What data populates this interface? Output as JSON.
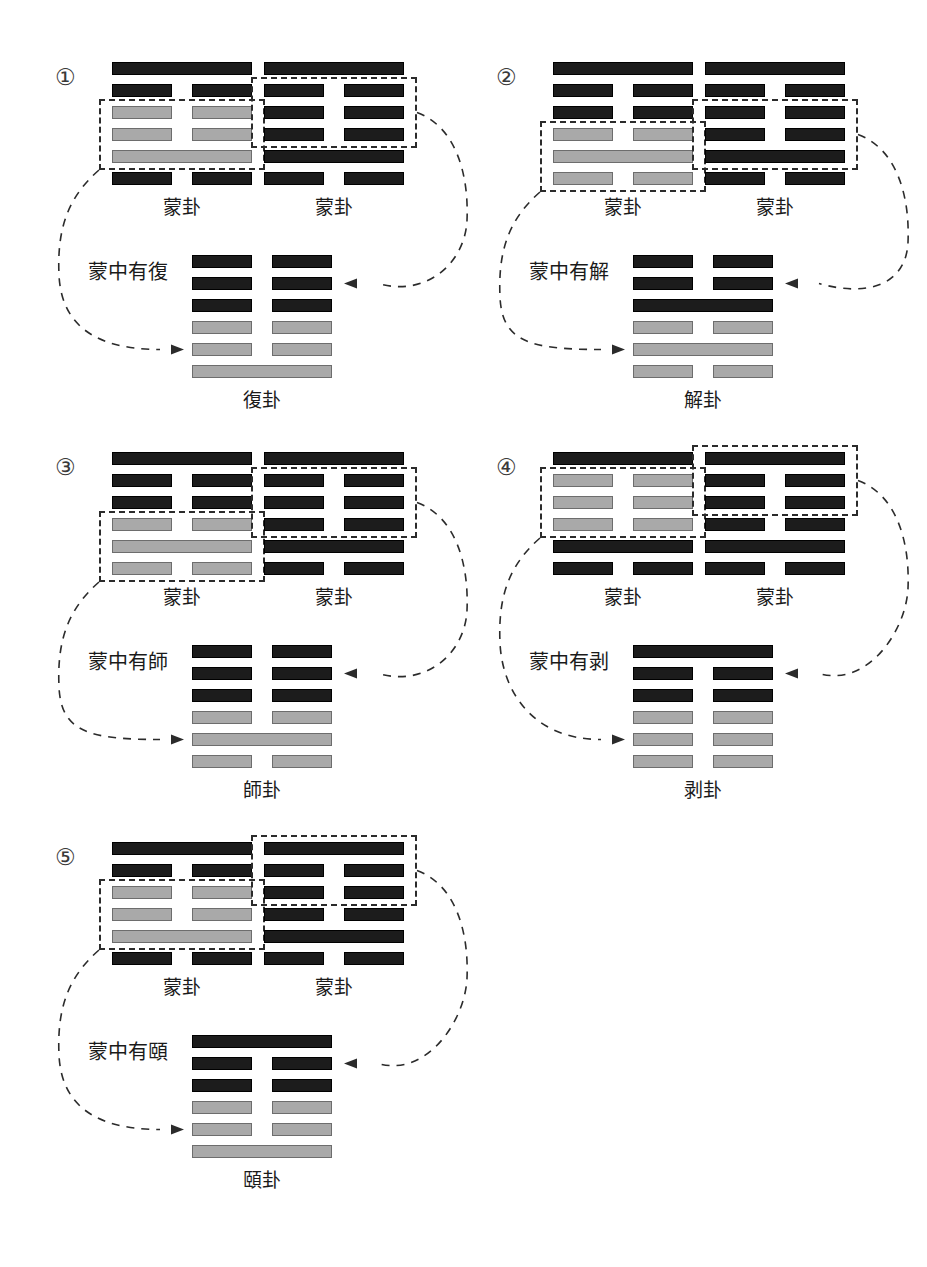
{
  "palette": {
    "dark_line": "#1c1c1c",
    "gray_line": "#a9a9a9",
    "dash_stroke": "#2b2b2b",
    "background": "#ffffff"
  },
  "figure": {
    "hexagram_line_types": [
      "solid",
      "broken"
    ],
    "hexagram_line_shades": [
      "dark",
      "gray"
    ]
  },
  "groups": [
    {
      "number": "①",
      "source_left": {
        "label": "蒙卦",
        "lines": [
          {
            "type": "solid",
            "shade": "dark"
          },
          {
            "type": "broken",
            "shade": "dark"
          },
          {
            "type": "broken",
            "shade": "gray"
          },
          {
            "type": "broken",
            "shade": "gray"
          },
          {
            "type": "solid",
            "shade": "gray"
          },
          {
            "type": "broken",
            "shade": "dark"
          }
        ],
        "selection": [
          3,
          4,
          5
        ]
      },
      "source_right": {
        "label": "蒙卦",
        "lines": [
          {
            "type": "solid",
            "shade": "dark"
          },
          {
            "type": "broken",
            "shade": "dark"
          },
          {
            "type": "broken",
            "shade": "dark"
          },
          {
            "type": "broken",
            "shade": "dark"
          },
          {
            "type": "solid",
            "shade": "dark"
          },
          {
            "type": "broken",
            "shade": "dark"
          }
        ],
        "selection": [
          2,
          3,
          4
        ]
      },
      "phrase": "蒙中有復",
      "result": {
        "label": "復卦",
        "lines": [
          {
            "type": "broken",
            "shade": "dark"
          },
          {
            "type": "broken",
            "shade": "dark"
          },
          {
            "type": "broken",
            "shade": "dark"
          },
          {
            "type": "broken",
            "shade": "gray"
          },
          {
            "type": "broken",
            "shade": "gray"
          },
          {
            "type": "solid",
            "shade": "gray"
          }
        ]
      }
    },
    {
      "number": "②",
      "source_left": {
        "label": "蒙卦",
        "lines": [
          {
            "type": "solid",
            "shade": "dark"
          },
          {
            "type": "broken",
            "shade": "dark"
          },
          {
            "type": "broken",
            "shade": "dark"
          },
          {
            "type": "broken",
            "shade": "gray"
          },
          {
            "type": "solid",
            "shade": "gray"
          },
          {
            "type": "broken",
            "shade": "gray"
          }
        ],
        "selection": [
          4,
          5,
          6
        ]
      },
      "source_right": {
        "label": "蒙卦",
        "lines": [
          {
            "type": "solid",
            "shade": "dark"
          },
          {
            "type": "broken",
            "shade": "dark"
          },
          {
            "type": "broken",
            "shade": "dark"
          },
          {
            "type": "broken",
            "shade": "dark"
          },
          {
            "type": "solid",
            "shade": "dark"
          },
          {
            "type": "broken",
            "shade": "dark"
          }
        ],
        "selection": [
          3,
          4,
          5
        ]
      },
      "phrase": "蒙中有解",
      "result": {
        "label": "解卦",
        "lines": [
          {
            "type": "broken",
            "shade": "dark"
          },
          {
            "type": "broken",
            "shade": "dark"
          },
          {
            "type": "solid",
            "shade": "dark"
          },
          {
            "type": "broken",
            "shade": "gray"
          },
          {
            "type": "solid",
            "shade": "gray"
          },
          {
            "type": "broken",
            "shade": "gray"
          }
        ]
      }
    },
    {
      "number": "③",
      "source_left": {
        "label": "蒙卦",
        "lines": [
          {
            "type": "solid",
            "shade": "dark"
          },
          {
            "type": "broken",
            "shade": "dark"
          },
          {
            "type": "broken",
            "shade": "dark"
          },
          {
            "type": "broken",
            "shade": "gray"
          },
          {
            "type": "solid",
            "shade": "gray"
          },
          {
            "type": "broken",
            "shade": "gray"
          }
        ],
        "selection": [
          4,
          5,
          6
        ]
      },
      "source_right": {
        "label": "蒙卦",
        "lines": [
          {
            "type": "solid",
            "shade": "dark"
          },
          {
            "type": "broken",
            "shade": "dark"
          },
          {
            "type": "broken",
            "shade": "dark"
          },
          {
            "type": "broken",
            "shade": "dark"
          },
          {
            "type": "solid",
            "shade": "dark"
          },
          {
            "type": "broken",
            "shade": "dark"
          }
        ],
        "selection": [
          2,
          3,
          4
        ]
      },
      "phrase": "蒙中有師",
      "result": {
        "label": "師卦",
        "lines": [
          {
            "type": "broken",
            "shade": "dark"
          },
          {
            "type": "broken",
            "shade": "dark"
          },
          {
            "type": "broken",
            "shade": "dark"
          },
          {
            "type": "broken",
            "shade": "gray"
          },
          {
            "type": "solid",
            "shade": "gray"
          },
          {
            "type": "broken",
            "shade": "gray"
          }
        ]
      }
    },
    {
      "number": "④",
      "source_left": {
        "label": "蒙卦",
        "lines": [
          {
            "type": "solid",
            "shade": "dark"
          },
          {
            "type": "broken",
            "shade": "gray"
          },
          {
            "type": "broken",
            "shade": "gray"
          },
          {
            "type": "broken",
            "shade": "gray"
          },
          {
            "type": "solid",
            "shade": "dark"
          },
          {
            "type": "broken",
            "shade": "dark"
          }
        ],
        "selection": [
          2,
          3,
          4
        ]
      },
      "source_right": {
        "label": "蒙卦",
        "lines": [
          {
            "type": "solid",
            "shade": "dark"
          },
          {
            "type": "broken",
            "shade": "dark"
          },
          {
            "type": "broken",
            "shade": "dark"
          },
          {
            "type": "broken",
            "shade": "dark"
          },
          {
            "type": "solid",
            "shade": "dark"
          },
          {
            "type": "broken",
            "shade": "dark"
          }
        ],
        "selection": [
          1,
          2,
          3
        ]
      },
      "phrase": "蒙中有剥",
      "result": {
        "label": "剥卦",
        "lines": [
          {
            "type": "solid",
            "shade": "dark"
          },
          {
            "type": "broken",
            "shade": "dark"
          },
          {
            "type": "broken",
            "shade": "dark"
          },
          {
            "type": "broken",
            "shade": "gray"
          },
          {
            "type": "broken",
            "shade": "gray"
          },
          {
            "type": "broken",
            "shade": "gray"
          }
        ]
      }
    },
    {
      "number": "⑤",
      "source_left": {
        "label": "蒙卦",
        "lines": [
          {
            "type": "solid",
            "shade": "dark"
          },
          {
            "type": "broken",
            "shade": "dark"
          },
          {
            "type": "broken",
            "shade": "gray"
          },
          {
            "type": "broken",
            "shade": "gray"
          },
          {
            "type": "solid",
            "shade": "gray"
          },
          {
            "type": "broken",
            "shade": "dark"
          }
        ],
        "selection": [
          3,
          4,
          5
        ]
      },
      "source_right": {
        "label": "蒙卦",
        "lines": [
          {
            "type": "solid",
            "shade": "dark"
          },
          {
            "type": "broken",
            "shade": "dark"
          },
          {
            "type": "broken",
            "shade": "dark"
          },
          {
            "type": "broken",
            "shade": "dark"
          },
          {
            "type": "solid",
            "shade": "dark"
          },
          {
            "type": "broken",
            "shade": "dark"
          }
        ],
        "selection": [
          1,
          2,
          3
        ]
      },
      "phrase": "蒙中有頤",
      "result": {
        "label": "頤卦",
        "lines": [
          {
            "type": "solid",
            "shade": "dark"
          },
          {
            "type": "broken",
            "shade": "dark"
          },
          {
            "type": "broken",
            "shade": "dark"
          },
          {
            "type": "broken",
            "shade": "gray"
          },
          {
            "type": "broken",
            "shade": "gray"
          },
          {
            "type": "solid",
            "shade": "gray"
          }
        ]
      }
    }
  ]
}
